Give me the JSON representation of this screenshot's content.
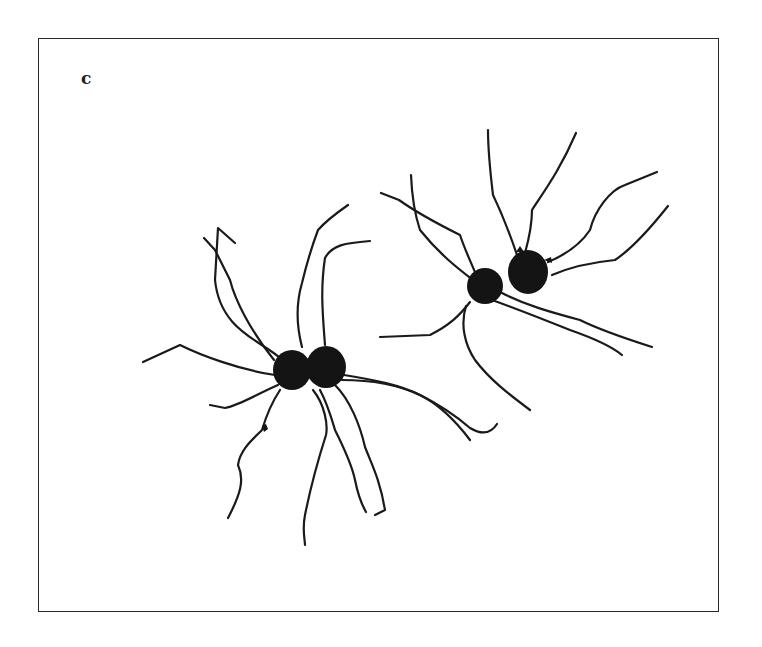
{
  "figure": {
    "panel_label": "c",
    "colors": {
      "ink": "#141414",
      "background": "#ffffff",
      "frame": "#2a2a2a"
    },
    "cell_groups": [
      {
        "name": "left-pair",
        "cells": 2
      },
      {
        "name": "right-pair",
        "cells": 2
      }
    ]
  }
}
